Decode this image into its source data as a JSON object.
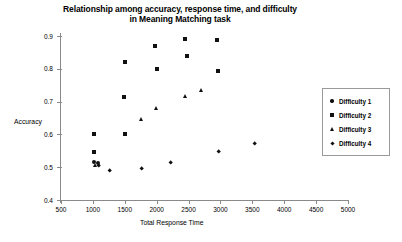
{
  "chart_data": {
    "type": "scatter",
    "title": "Relationship among accuracy, response time, and difficulty in Meaning Matching task",
    "title_lines": [
      "Relationship among accuracy, response time, and difficulty",
      "in Meaning Matching task"
    ],
    "xlabel": "Total Response Time",
    "ylabel": "Accuracy",
    "xlim": [
      500,
      5000
    ],
    "ylim": [
      0.4,
      0.9
    ],
    "xticks": [
      500,
      1000,
      1500,
      2000,
      2500,
      3000,
      3500,
      4000,
      4500,
      5000
    ],
    "xtick_labels": [
      "500",
      "1000",
      "1500",
      "2000",
      "2500",
      "3000",
      "3500",
      "4000",
      "4500",
      "5000"
    ],
    "yticks": [
      0.4,
      0.5,
      0.6,
      0.7,
      0.8,
      0.9
    ],
    "ytick_labels": [
      "0.4",
      "0.5",
      "0.6",
      "0.7",
      "0.8",
      "0.9"
    ],
    "grid": false,
    "legend_position": "right",
    "series": [
      {
        "name": "Difficulty 1",
        "marker": "circle",
        "color": "#111111",
        "points": [
          {
            "x": 1020,
            "y": 0.515
          },
          {
            "x": 1075,
            "y": 0.513
          }
        ]
      },
      {
        "name": "Difficulty 2",
        "marker": "square",
        "color": "#111111",
        "points": [
          {
            "x": 1010,
            "y": 0.6
          },
          {
            "x": 1020,
            "y": 0.545
          },
          {
            "x": 1490,
            "y": 0.715
          },
          {
            "x": 1500,
            "y": 0.6
          },
          {
            "x": 1510,
            "y": 0.82
          },
          {
            "x": 1980,
            "y": 0.868
          },
          {
            "x": 2000,
            "y": 0.8
          },
          {
            "x": 2450,
            "y": 0.89
          },
          {
            "x": 2470,
            "y": 0.838
          },
          {
            "x": 2950,
            "y": 0.888
          },
          {
            "x": 2960,
            "y": 0.793
          }
        ]
      },
      {
        "name": "Difficulty 3",
        "marker": "triangle",
        "color": "#111111",
        "points": [
          {
            "x": 1040,
            "y": 0.505
          },
          {
            "x": 1510,
            "y": 0.6
          },
          {
            "x": 1760,
            "y": 0.645
          },
          {
            "x": 2000,
            "y": 0.68
          },
          {
            "x": 2460,
            "y": 0.715
          },
          {
            "x": 2700,
            "y": 0.735
          }
        ]
      },
      {
        "name": "Difficulty 4",
        "marker": "diamond",
        "color": "#111111",
        "points": [
          {
            "x": 1090,
            "y": 0.505
          },
          {
            "x": 1260,
            "y": 0.49
          },
          {
            "x": 1760,
            "y": 0.495
          },
          {
            "x": 2220,
            "y": 0.515
          },
          {
            "x": 2980,
            "y": 0.548
          },
          {
            "x": 3530,
            "y": 0.572
          }
        ]
      }
    ]
  },
  "legend": {
    "items": [
      {
        "label": "Difficulty 1",
        "marker": "circle"
      },
      {
        "label": "Difficulty 2",
        "marker": "square"
      },
      {
        "label": "Difficulty 3",
        "marker": "triangle"
      },
      {
        "label": "Difficulty 4",
        "marker": "diamond"
      }
    ]
  }
}
